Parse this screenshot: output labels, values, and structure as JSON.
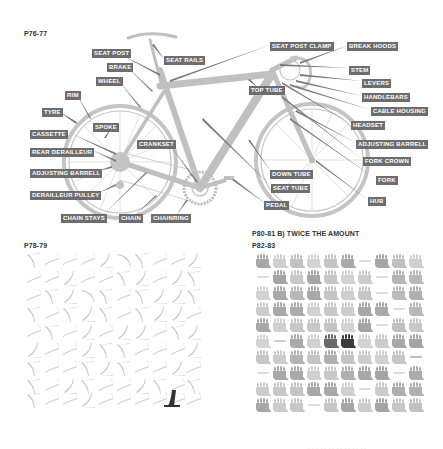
{
  "sections": {
    "bike": {
      "page": "P76-77"
    },
    "pedals": {
      "page": "P78-79"
    },
    "twice": {
      "page": "P80-81 B) TWICE THE AMOUNT"
    },
    "gloves": {
      "page": "P82-83"
    }
  },
  "bike_labels": [
    {
      "id": "seat-post",
      "text": "SEAT POST",
      "x": 92,
      "y": 51
    },
    {
      "id": "seat-rails",
      "text": "SEAT RAILS",
      "x": 164,
      "y": 56
    },
    {
      "id": "brake",
      "text": "BRAKE",
      "x": 107,
      "y": 64
    },
    {
      "id": "wheel",
      "text": "WHEEL",
      "x": 96,
      "y": 77
    },
    {
      "id": "rim",
      "text": "RIM",
      "x": 65,
      "y": 91
    },
    {
      "id": "tyre",
      "text": "TYRE",
      "x": 42,
      "y": 108
    },
    {
      "id": "spoke",
      "text": "SPOKE",
      "x": 93,
      "y": 124
    },
    {
      "id": "cassette",
      "text": "CASSETTE",
      "x": 30,
      "y": 131
    },
    {
      "id": "rear-derailleur",
      "text": "REAR DERAILLEUR",
      "x": 30,
      "y": 148
    },
    {
      "id": "crankset",
      "text": "CRANKSET",
      "x": 137,
      "y": 142
    },
    {
      "id": "adjusting-barrell-rear",
      "text": "ADJUSTING BARRELL",
      "x": 30,
      "y": 169
    },
    {
      "id": "derailleur-pulley",
      "text": "DERAILLEUR PULLEY",
      "x": 30,
      "y": 191
    },
    {
      "id": "chain-stays",
      "text": "CHAIN STAYS",
      "x": 61,
      "y": 214
    },
    {
      "id": "chain",
      "text": "CHAIN",
      "x": 119,
      "y": 214
    },
    {
      "id": "chainring",
      "text": "CHAINRING",
      "x": 151,
      "y": 214
    },
    {
      "id": "seat-post-clamp",
      "text": "SEAT POST CLAMP",
      "x": 270,
      "y": 43
    },
    {
      "id": "break-hoods",
      "text": "BREAK HOODS",
      "x": 347,
      "y": 43
    },
    {
      "id": "top-tube",
      "text": "TOP TUBE",
      "x": 249,
      "y": 86
    },
    {
      "id": "stem",
      "text": "STEM",
      "x": 349,
      "y": 66
    },
    {
      "id": "levers",
      "text": "LEVERS",
      "x": 362,
      "y": 79
    },
    {
      "id": "handlebars",
      "text": "HANDLEBARS",
      "x": 362,
      "y": 94
    },
    {
      "id": "cable-housing",
      "text": "CABLE HOUSING",
      "x": 371,
      "y": 108
    },
    {
      "id": "headset",
      "text": "HEADSET",
      "x": 351,
      "y": 122
    },
    {
      "id": "adjusting-barrell-front",
      "text": "ADJUSTING BARRELL",
      "x": 356,
      "y": 141
    },
    {
      "id": "fork-crown",
      "text": "FORK CROWN",
      "x": 363,
      "y": 158
    },
    {
      "id": "fork",
      "text": "FORK",
      "x": 376,
      "y": 177
    },
    {
      "id": "down-tube",
      "text": "DOWN TUBE",
      "x": 270,
      "y": 171
    },
    {
      "id": "seat-tube",
      "text": "SEAT TUBE",
      "x": 271,
      "y": 185
    },
    {
      "id": "pedal",
      "text": "PEDAL",
      "x": 264,
      "y": 202
    },
    {
      "id": "hub",
      "text": "HUB",
      "x": 368,
      "y": 198
    }
  ],
  "colors": {
    "label_bg": "#6d6d6d",
    "label_text": "#ffffff",
    "bike_gray": "#bdbdbd",
    "leader_gray": "#777777",
    "highlight_dark": "#3a3a3a"
  },
  "footer": {
    "text": "· · · · · · · · · · · · · · ·"
  }
}
